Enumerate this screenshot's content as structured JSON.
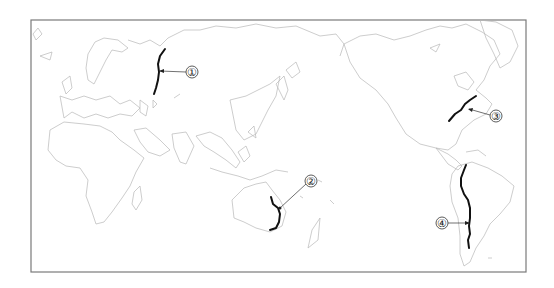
{
  "map": {
    "type": "world-outline-map",
    "projection_center": "Pacific (~150°E)",
    "frame": {
      "x": 31,
      "y": 20,
      "width": 495,
      "height": 252
    },
    "colors": {
      "coastline": "#b8b8b8",
      "frame": "#7a7a7a",
      "feature_line": "#111111"
    },
    "markers": [
      {
        "id": 1,
        "label": "①",
        "feature": "mountain-range-line",
        "region": "Ural Mountains (Russia)"
      },
      {
        "id": 2,
        "label": "②",
        "feature": "mountain-range-line",
        "region": "Great Dividing Range (eastern Australia)"
      },
      {
        "id": 3,
        "label": "③",
        "feature": "mountain-range-line",
        "region": "Appalachian Mountains (eastern North America)"
      },
      {
        "id": 4,
        "label": "④",
        "feature": "mountain-range-line",
        "region": "Andes Mountains (western South America)"
      }
    ]
  }
}
